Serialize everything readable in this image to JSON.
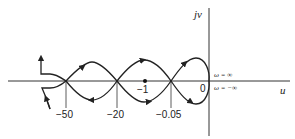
{
  "diagram": {
    "type": "nyquist_plot",
    "axes": {
      "horizontal_label": "u",
      "vertical_label": "jv"
    },
    "tick_labels": [
      {
        "text": "−50",
        "value": -50
      },
      {
        "text": "−20",
        "value": -20
      },
      {
        "text": "−1",
        "value": -1
      },
      {
        "text": "−0.05",
        "value": -0.05
      },
      {
        "text": "0",
        "value": 0
      }
    ],
    "annotations": {
      "omega_pos": "ω = ∞",
      "omega_neg": "ω = −∞"
    },
    "colors": {
      "stroke": "#222222",
      "background": "#ffffff"
    }
  }
}
